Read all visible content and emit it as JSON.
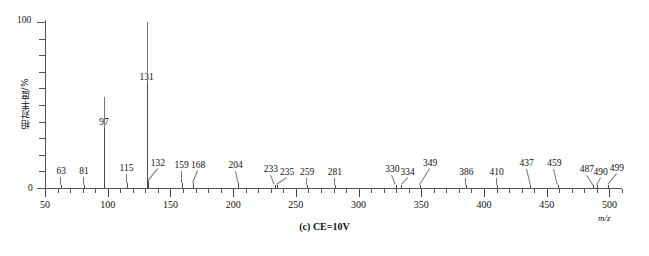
{
  "chart_data": {
    "type": "bar",
    "title": "",
    "caption": "(c) CE=10V",
    "xlabel": "m/z",
    "ylabel": "相对丰度/%",
    "xlim": [
      50,
      510
    ],
    "ylim": [
      0,
      100
    ],
    "grid": false,
    "legend": "none",
    "x_major_ticks": [
      50,
      100,
      150,
      200,
      250,
      300,
      350,
      400,
      450,
      500
    ],
    "x_minor_tick_step": 10,
    "y_major_ticks": [
      0,
      100
    ],
    "y_minor_tick_step": 10,
    "x_tick_labels": [
      "50",
      "100",
      "150",
      "200",
      "250",
      "300",
      "350",
      "400",
      "450",
      "500"
    ],
    "y_tick_labels": [
      "0",
      "100"
    ],
    "peaks": [
      {
        "mz": 63,
        "intensity": 2,
        "label": "63",
        "label_x": 63,
        "label_y": 11
      },
      {
        "mz": 81,
        "intensity": 2,
        "label": "81",
        "label_x": 81,
        "label_y": 11
      },
      {
        "mz": 97,
        "intensity": 55,
        "label": "97",
        "label_x": 97,
        "label_y": 60
      },
      {
        "mz": 115,
        "intensity": 3,
        "label": "115",
        "label_x": 115,
        "label_y": 14
      },
      {
        "mz": 131,
        "intensity": 100,
        "label": "131",
        "label_x": 131,
        "label_y": 105
      },
      {
        "mz": 132,
        "intensity": 4,
        "label": "132",
        "label_x": 140,
        "label_y": 19
      },
      {
        "mz": 159,
        "intensity": 3,
        "label": "159",
        "label_x": 159,
        "label_y": 17
      },
      {
        "mz": 168,
        "intensity": 3,
        "label": "168",
        "label_x": 172,
        "label_y": 17
      },
      {
        "mz": 204,
        "intensity": 3,
        "label": "204",
        "label_x": 202,
        "label_y": 17
      },
      {
        "mz": 233,
        "intensity": 2,
        "label": "233",
        "label_x": 230,
        "label_y": 13
      },
      {
        "mz": 235,
        "intensity": 2,
        "label": "235",
        "label_x": 243,
        "label_y": 10
      },
      {
        "mz": 259,
        "intensity": 2,
        "label": "259",
        "label_x": 259,
        "label_y": 10
      },
      {
        "mz": 281,
        "intensity": 2,
        "label": "281",
        "label_x": 281,
        "label_y": 10
      },
      {
        "mz": 330,
        "intensity": 2,
        "label": "330",
        "label_x": 327,
        "label_y": 13
      },
      {
        "mz": 334,
        "intensity": 2,
        "label": "334",
        "label_x": 339,
        "label_y": 10
      },
      {
        "mz": 349,
        "intensity": 2,
        "label": "349",
        "label_x": 357,
        "label_y": 19
      },
      {
        "mz": 386,
        "intensity": 2,
        "label": "386",
        "label_x": 386,
        "label_y": 10
      },
      {
        "mz": 410,
        "intensity": 2,
        "label": "410",
        "label_x": 410,
        "label_y": 10
      },
      {
        "mz": 437,
        "intensity": 2,
        "label": "437",
        "label_x": 434,
        "label_y": 19
      },
      {
        "mz": 459,
        "intensity": 2,
        "label": "459",
        "label_x": 456,
        "label_y": 19
      },
      {
        "mz": 487,
        "intensity": 2,
        "label": "487",
        "label_x": 482,
        "label_y": 13
      },
      {
        "mz": 490,
        "intensity": 2,
        "label": "490",
        "label_x": 493,
        "label_y": 10
      },
      {
        "mz": 499,
        "intensity": 2,
        "label": "499",
        "label_x": 506,
        "label_y": 14
      }
    ]
  },
  "axis": {
    "y_top_label": "100",
    "y_bottom_label": "0",
    "y_title": "相对丰度/%",
    "x_unit": "m/z"
  },
  "figure": {
    "caption": "(c) CE=10V"
  }
}
